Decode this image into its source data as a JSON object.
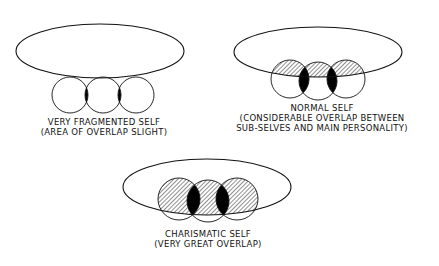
{
  "colors": {
    "stroke": "#111111",
    "overlap_main": "hatched",
    "overlap_subselves": "#000000",
    "background": "#ffffff"
  },
  "diagrams": [
    {
      "id": "fragmented",
      "title": "VERY FRAGMENTED SELF",
      "caption": "(AREA OF OVERLAP SLIGHT)",
      "ellipse": {
        "cx": 100,
        "cy": 51,
        "rx": 84,
        "ry": 27
      },
      "circles": [
        {
          "cx": 70,
          "cy": 95,
          "r": 18
        },
        {
          "cx": 103,
          "cy": 95,
          "r": 18
        },
        {
          "cx": 136,
          "cy": 95,
          "r": 18
        }
      ],
      "label_pos": {
        "x": 104,
        "y": 117
      }
    },
    {
      "id": "normal",
      "title": "NORMAL SELF",
      "caption_lines": [
        "(CONSIDERABLE OVERLAP BETWEEN",
        "SUB-SELVES AND MAIN PERSONALITY)"
      ],
      "ellipse": {
        "cx": 318,
        "cy": 52,
        "rx": 84,
        "ry": 25
      },
      "circles": [
        {
          "cx": 290,
          "cy": 79,
          "r": 19
        },
        {
          "cx": 318,
          "cy": 81,
          "r": 19
        },
        {
          "cx": 346,
          "cy": 79,
          "r": 19
        }
      ],
      "label_pos": {
        "x": 322,
        "y": 103
      }
    },
    {
      "id": "charismatic",
      "title": "CHARISMATIC SELF",
      "caption": "(VERY GREAT OVERLAP)",
      "ellipse": {
        "cx": 207,
        "cy": 187,
        "rx": 84,
        "ry": 28
      },
      "circles": [
        {
          "cx": 179,
          "cy": 199,
          "r": 21
        },
        {
          "cx": 208,
          "cy": 201,
          "r": 21
        },
        {
          "cx": 237,
          "cy": 199,
          "r": 21
        }
      ],
      "label_pos": {
        "x": 208,
        "y": 229
      }
    }
  ]
}
